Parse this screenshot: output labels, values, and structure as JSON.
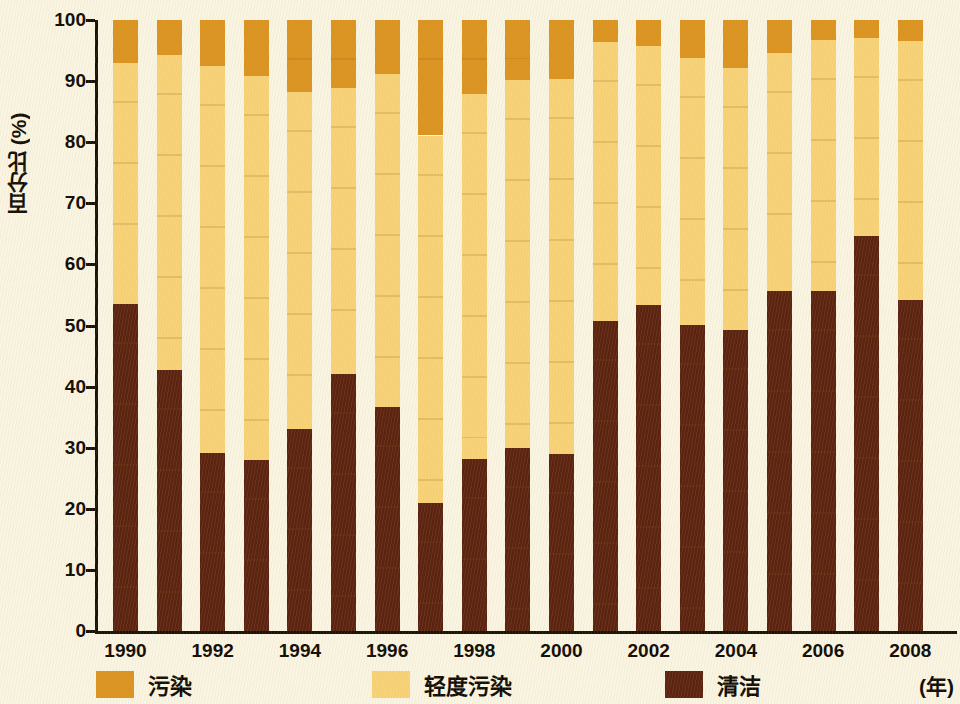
{
  "chart_data": {
    "type": "bar",
    "subtype": "stacked-percentage",
    "title": "",
    "xlabel": "(年)",
    "ylabel": "百分比 (%)",
    "ylim": [
      0,
      100
    ],
    "yticks": [
      0,
      10,
      20,
      30,
      40,
      50,
      60,
      70,
      80,
      90,
      100
    ],
    "ytick_labels": [
      "0",
      "10",
      "20",
      "30",
      "40",
      "50",
      "60",
      "70",
      "80",
      "90",
      "100"
    ],
    "grid": false,
    "legend_position": "bottom",
    "x": [
      1990,
      1991,
      1992,
      1993,
      1994,
      1995,
      1996,
      1997,
      1998,
      1999,
      2000,
      2001,
      2002,
      2003,
      2004,
      2005,
      2006,
      2007,
      2008
    ],
    "categories": [
      "1990",
      "1991",
      "1992",
      "1993",
      "1994",
      "1995",
      "1996",
      "1997",
      "1998",
      "1999",
      "2000",
      "2001",
      "2002",
      "2003",
      "2004",
      "2005",
      "2006",
      "2007",
      "2008"
    ],
    "xtick_labels": [
      "1990",
      "1992",
      "1994",
      "1996",
      "1998",
      "2000",
      "2002",
      "2004",
      "2006",
      "2008"
    ],
    "series": [
      {
        "name": "清洁",
        "name_en": "clean",
        "color": "#5C2410",
        "values": [
          53.6,
          42.8,
          29.1,
          28.0,
          33.1,
          42.1,
          36.6,
          21.0,
          28.2,
          29.9,
          29.0,
          50.8,
          53.3,
          50.1,
          49.2,
          55.6,
          55.7,
          64.7,
          54.2
        ]
      },
      {
        "name": "轻度污染",
        "name_en": "light-pollution",
        "color": "#F7D276",
        "values": [
          39.3,
          51.4,
          63.3,
          62.8,
          55.2,
          46.7,
          54.5,
          60.1,
          59.7,
          60.3,
          61.4,
          45.6,
          42.4,
          43.7,
          42.9,
          39.0,
          41.0,
          32.4,
          42.3
        ]
      },
      {
        "name": "污染",
        "name_en": "pollution",
        "color": "#DB9420",
        "values": [
          7.1,
          5.8,
          7.6,
          9.2,
          11.7,
          11.2,
          8.9,
          18.9,
          12.1,
          9.8,
          9.6,
          3.6,
          4.3,
          6.2,
          7.9,
          5.4,
          3.3,
          2.9,
          3.5
        ]
      }
    ],
    "stack_order_bottom_to_top": [
      "清洁",
      "轻度污染",
      "污染"
    ],
    "legend": [
      {
        "label": "污染",
        "color": "#DB9420"
      },
      {
        "label": "轻度污染",
        "color": "#F7D276"
      },
      {
        "label": "清洁",
        "color": "#5C2410"
      }
    ],
    "colors": {
      "background": "#FAF5E2",
      "axis": "#1A1206",
      "pollution": "#DB9420",
      "light_pollution": "#F7D276",
      "clean": "#5C2410"
    }
  }
}
